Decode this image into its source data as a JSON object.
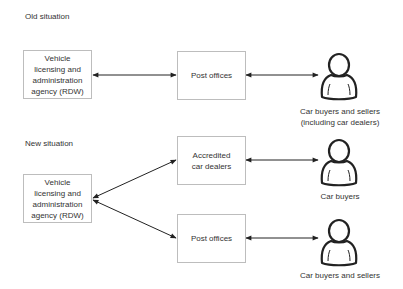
{
  "diagram": {
    "old_situation": {
      "heading": "Old situation",
      "nodes": {
        "agency": "Vehicle\nlicensing and\nadministration\nagency (RDW)",
        "post_offices": "Post offices",
        "actor": "Car buyers and sellers\n(including car dealers)"
      },
      "edges": [
        {
          "from": "agency",
          "to": "post_offices",
          "type": "bidirectional"
        },
        {
          "from": "post_offices",
          "to": "actor",
          "type": "bidirectional"
        }
      ]
    },
    "new_situation": {
      "heading": "New situation",
      "nodes": {
        "agency": "Vehicle\nlicensing and\nadministration\nagency (RDW)",
        "accredited_dealers": "Accredited\ncar dealers",
        "post_offices": "Post offices",
        "actor_buyers": "Car buyers",
        "actor_buyers_sellers": "Car buyers and sellers"
      },
      "edges": [
        {
          "from": "agency",
          "to": "accredited_dealers",
          "type": "bidirectional"
        },
        {
          "from": "agency",
          "to": "post_offices",
          "type": "bidirectional"
        },
        {
          "from": "accredited_dealers",
          "to": "actor_buyers",
          "type": "bidirectional"
        },
        {
          "from": "post_offices",
          "to": "actor_buyers_sellers",
          "type": "bidirectional"
        }
      ]
    }
  },
  "colors": {
    "box_border": "#bdbdbd",
    "arrow": "#222222",
    "text": "#333333"
  }
}
